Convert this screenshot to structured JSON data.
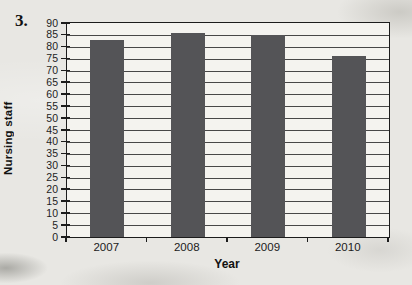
{
  "page": {
    "question_number": "3.",
    "background_color": "#e8e7e3"
  },
  "chart_data": {
    "type": "bar",
    "categories": [
      "2007",
      "2008",
      "2009",
      "2010"
    ],
    "values": [
      83,
      86,
      85,
      76
    ],
    "title": "",
    "xlabel": "Year",
    "ylabel": "Nursing staff",
    "ylim": [
      0,
      90
    ],
    "ytick_step": 5,
    "ytick_labels": [
      0,
      5,
      10,
      15,
      20,
      25,
      30,
      35,
      40,
      45,
      50,
      55,
      60,
      65,
      70,
      75,
      80,
      85,
      90
    ],
    "grid": true,
    "legend": "none",
    "bar_color": "#545457",
    "plot_background": "#f4f3ef",
    "gridline_color": "#474747",
    "axis_color": "#1c1c1c",
    "text_color": "#1b1b1b"
  }
}
